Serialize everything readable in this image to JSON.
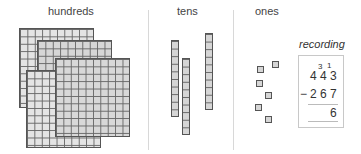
{
  "columns": {
    "hundreds": {
      "label": "hundreds",
      "count": 4
    },
    "tens": {
      "label": "tens",
      "count": 3
    },
    "ones": {
      "label": "ones",
      "count": 6
    }
  },
  "recording": {
    "title": "recording",
    "top_number": [
      "4",
      "4",
      "3"
    ],
    "regroup_marks": [
      "3",
      "1"
    ],
    "operator": "−",
    "subtrahend": [
      "2",
      "6",
      "7"
    ],
    "result": "6"
  },
  "colors": {
    "block_fill": "#dedede",
    "block_line": "#666666",
    "divider": "#d8d8d8"
  }
}
